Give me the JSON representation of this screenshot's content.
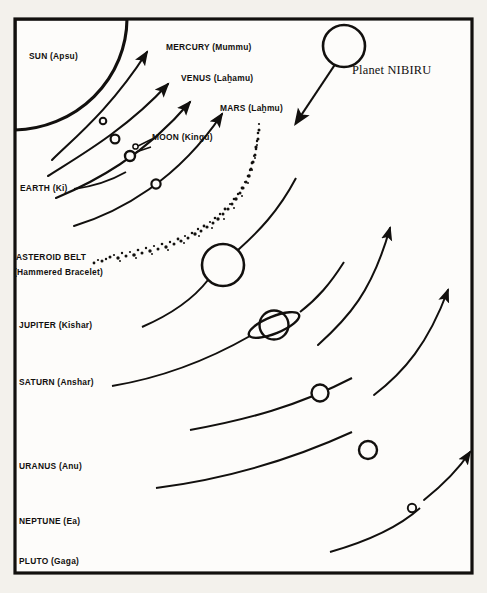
{
  "figure": {
    "background_color": "#f3f1ec",
    "ink_color": "#12100e",
    "frame": {
      "stroke_width": 3
    }
  },
  "bodies": {
    "sun": {
      "label": "SUN (Apsu)",
      "name": "SUN",
      "sumerian": "Apsu"
    },
    "mercury": {
      "label": "MERCURY (Mummu)",
      "name": "MERCURY",
      "sumerian": "Mummu"
    },
    "venus": {
      "label": "VENUS (Laḫamu)",
      "name": "VENUS",
      "sumerian": "Laḫamu"
    },
    "mars": {
      "label": "MARS (Laḫmu)",
      "name": "MARS",
      "sumerian": "Laḫmu"
    },
    "moon": {
      "label": "MOON (Kingu)",
      "name": "MOON",
      "sumerian": "Kingu"
    },
    "earth": {
      "label": "EARTH (Ki)",
      "name": "EARTH",
      "sumerian": "Ki"
    },
    "asteroid_belt": {
      "label": "ASTEROID BELT",
      "sublabel": "(Hammered Bracelet)"
    },
    "jupiter": {
      "label": "JUPITER  (Kishar)",
      "name": "JUPITER",
      "sumerian": "Kishar"
    },
    "saturn": {
      "label": "SATURN (Anshar)",
      "name": "SATURN",
      "sumerian": "Anshar"
    },
    "uranus": {
      "label": "URANUS (Anu)",
      "name": "URANUS",
      "sumerian": "Anu"
    },
    "neptune": {
      "label": "NEPTUNE (Ea)",
      "name": "NEPTUNE",
      "sumerian": "Ea"
    },
    "pluto": {
      "label": "PLUTO (Gaga)",
      "name": "PLUTO",
      "sumerian": "Gaga"
    },
    "nibiru": {
      "label": "Planet NIBIRU",
      "name": "NIBIRU"
    }
  },
  "icons": {
    "sun_quarter": "sun-quarter-disc-icon",
    "ringed_planet": "ringed-planet-icon",
    "orbit_arc": "orbit-arc-arrow-icon",
    "asteroid_band": "asteroid-belt-band-icon",
    "nibiru_arrow": "nibiru-trajectory-arrow-icon"
  }
}
